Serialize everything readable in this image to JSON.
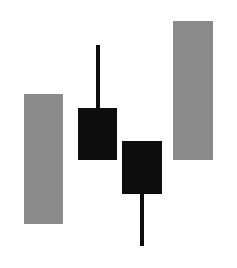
{
  "canvas": {
    "width": 237,
    "height": 268,
    "background": "#ffffff"
  },
  "palette": {
    "gray_body": "#8a8a8a",
    "black_body": "#0d0d0d",
    "wick": "#0d0d0d",
    "background": "#ffffff"
  },
  "chart_data": {
    "type": "bar",
    "title": "",
    "subtitle": "",
    "xlabel": "",
    "ylabel": "",
    "grid": false,
    "legend": null,
    "axis_visible": false,
    "tick_labels": [],
    "annotations": [],
    "note": "Four-element candlestick-style figure drawn as plain shapes: two light gray rectangles (no wicks) flanking two black candle bodies that each carry a single wick.",
    "categories": [
      "1",
      "2",
      "3",
      "4"
    ],
    "series": [
      {
        "name": "bodies",
        "values": [
          130,
          52,
          53,
          139
        ]
      }
    ],
    "elements": [
      {
        "index": 0,
        "name": "left-gray-bar",
        "shape": "rectangle",
        "fill": "#8a8a8a",
        "x": 24,
        "y": 94,
        "width": 39,
        "height": 130,
        "top_edge": 94,
        "bottom_edge": 224,
        "wick_upper": null,
        "wick_lower": null
      },
      {
        "index": 1,
        "name": "first-black-candle",
        "shape": "candle",
        "fill": "#0d0d0d",
        "x": 78,
        "y": 108,
        "width": 39,
        "height": 52,
        "top_edge": 108,
        "bottom_edge": 160,
        "wick_upper": {
          "x": 96,
          "y": 45,
          "width": 4,
          "height": 63,
          "top_edge": 45,
          "bottom_edge": 108
        },
        "wick_lower": null
      },
      {
        "index": 2,
        "name": "second-black-candle",
        "shape": "candle",
        "fill": "#0d0d0d",
        "x": 122,
        "y": 141,
        "width": 40,
        "height": 53,
        "top_edge": 141,
        "bottom_edge": 194,
        "wick_upper": null,
        "wick_lower": {
          "x": 140,
          "y": 194,
          "width": 4,
          "height": 52,
          "top_edge": 194,
          "bottom_edge": 246
        }
      },
      {
        "index": 3,
        "name": "right-gray-bar",
        "shape": "rectangle",
        "fill": "#8a8a8a",
        "x": 173,
        "y": 21,
        "width": 40,
        "height": 139,
        "top_edge": 21,
        "bottom_edge": 160,
        "wick_upper": null,
        "wick_lower": null
      }
    ]
  }
}
